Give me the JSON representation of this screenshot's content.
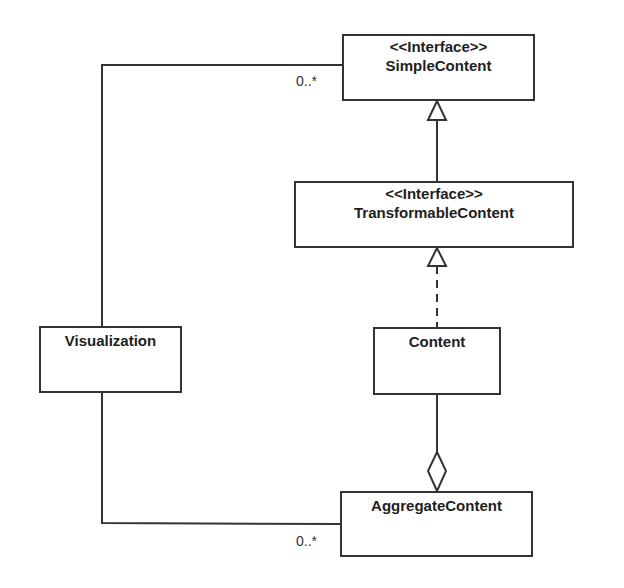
{
  "diagram": {
    "type": "uml-class-diagram",
    "classes": [
      {
        "id": "simple_content",
        "stereotype": "<<Interface>>",
        "name": "SimpleContent"
      },
      {
        "id": "transformable_content",
        "stereotype": "<<Interface>>",
        "name": "TransformableContent"
      },
      {
        "id": "visualization",
        "name": "Visualization"
      },
      {
        "id": "content",
        "name": "Content"
      },
      {
        "id": "aggregate_content",
        "name": "AggregateContent"
      }
    ],
    "relationships": [
      {
        "type": "generalization",
        "from": "TransformableContent",
        "to": "SimpleContent"
      },
      {
        "type": "realization",
        "from": "Content",
        "to": "TransformableContent"
      },
      {
        "type": "aggregation",
        "whole": "AggregateContent",
        "part": "Content"
      },
      {
        "type": "association",
        "from": "Visualization",
        "to": "SimpleContent",
        "multiplicity": "0..*"
      },
      {
        "type": "association",
        "from": "Visualization",
        "to": "AggregateContent",
        "multiplicity": "0..*"
      }
    ],
    "multiplicities": {
      "simple_content": "0..*",
      "aggregate_content": "0..*"
    }
  },
  "colors": {
    "line": "#333333",
    "background": "#ffffff"
  }
}
